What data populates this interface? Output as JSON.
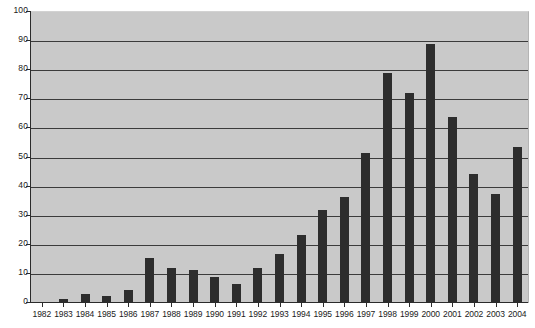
{
  "chart_data": {
    "type": "bar",
    "title": "",
    "subtitle": "",
    "xlabel": "",
    "ylabel": "",
    "ylim": [
      0,
      100
    ],
    "ytick_step": 10,
    "yticks": [
      100,
      90,
      80,
      70,
      60,
      50,
      40,
      30,
      20,
      10,
      0
    ],
    "ytick_labels": [
      "100",
      "90",
      "80",
      "70",
      "60",
      "50",
      "40",
      "30",
      "20",
      "10",
      "0"
    ],
    "grid": true,
    "legend": false,
    "legend_position": "none",
    "categories": [
      "1982",
      "1983",
      "1984",
      "1985",
      "1986",
      "1987",
      "1988",
      "1989",
      "1990",
      "1991",
      "1992",
      "1993",
      "1994",
      "1995",
      "1996",
      "1997",
      "1998",
      "1999",
      "2000",
      "2001",
      "2002",
      "2003",
      "2004"
    ],
    "values": [
      0.5,
      1.5,
      3,
      2.5,
      4.5,
      15.5,
      12,
      11.5,
      9,
      6.5,
      12,
      17,
      23.5,
      32,
      36.5,
      51.5,
      79,
      72,
      89,
      64,
      44.5,
      37.5,
      53.5
    ],
    "annotations": [],
    "colors": {
      "bar": "#2d2d2d",
      "plot_background": "#c9c9c9",
      "page_background": "#ffffff",
      "gridline": "#3b3b3b",
      "axis": "#2b2b2b",
      "text": "#1a1a1a"
    }
  }
}
